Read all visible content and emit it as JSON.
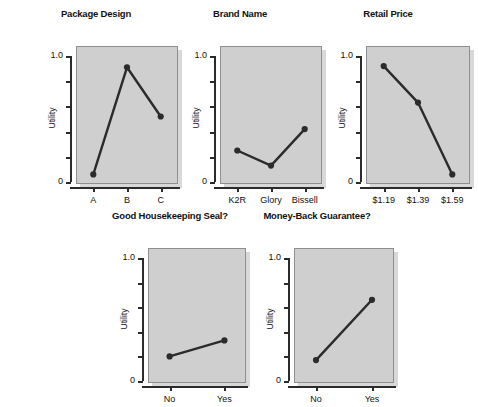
{
  "figure": {
    "background_color": "#ffffff",
    "panel_background_color": "#cfcfcf",
    "ink_color": "#2b2b2b",
    "ylabel": "Utility",
    "ytick_labels": [
      "1.0",
      "0"
    ]
  },
  "chart_data": [
    {
      "type": "line",
      "title": "Package Design",
      "xlabel": "",
      "ylabel": "Utility",
      "categories": [
        "A",
        "B",
        "C"
      ],
      "values": [
        0.06,
        0.91,
        0.52
      ],
      "ylim": [
        0,
        1.15
      ],
      "yticks": [
        0,
        1.0
      ],
      "ytick_labels": [
        "0",
        "1.0"
      ],
      "grid": false,
      "legend": "none",
      "markers": true
    },
    {
      "type": "line",
      "title": "Brand Name",
      "xlabel": "",
      "ylabel": "Utility",
      "categories": [
        "K2R",
        "Glory",
        "Bissell"
      ],
      "values": [
        0.25,
        0.13,
        0.42
      ],
      "ylim": [
        0,
        1.15
      ],
      "yticks": [
        0,
        1.0
      ],
      "ytick_labels": [
        "0",
        "1.0"
      ],
      "grid": false,
      "legend": "none",
      "markers": true
    },
    {
      "type": "line",
      "title": "Retail Price",
      "xlabel": "",
      "ylabel": "Utility",
      "categories": [
        "$1.19",
        "$1.39",
        "$1.59"
      ],
      "values": [
        0.92,
        0.63,
        0.06
      ],
      "ylim": [
        0,
        1.15
      ],
      "yticks": [
        0,
        1.0
      ],
      "ytick_labels": [
        "0",
        "1.0"
      ],
      "grid": false,
      "legend": "none",
      "markers": true
    },
    {
      "type": "line",
      "title": "Good Housekeeping Seal?",
      "xlabel": "",
      "ylabel": "Utility",
      "categories": [
        "No",
        "Yes"
      ],
      "values": [
        0.2,
        0.33
      ],
      "ylim": [
        0,
        1.15
      ],
      "yticks": [
        0,
        1.0
      ],
      "ytick_labels": [
        "0",
        "1.0"
      ],
      "grid": false,
      "legend": "none",
      "markers": true
    },
    {
      "type": "line",
      "title": "Money-Back Guarantee?",
      "xlabel": "",
      "ylabel": "Utility",
      "categories": [
        "No",
        "Yes"
      ],
      "values": [
        0.17,
        0.66
      ],
      "ylim": [
        0,
        1.15
      ],
      "yticks": [
        0,
        1.0
      ],
      "ytick_labels": [
        "0",
        "1.0"
      ],
      "grid": false,
      "legend": "none",
      "markers": true
    }
  ],
  "layout": {
    "panels": [
      {
        "left": 28,
        "top": 8,
        "width": 136,
        "height": 196,
        "plot_left": 48,
        "plot_top": 38,
        "plot_width": 102,
        "plot_height": 138
      },
      {
        "left": 172,
        "top": 8,
        "width": 136,
        "height": 196,
        "plot_left": 48,
        "plot_top": 38,
        "plot_width": 102,
        "plot_height": 138
      },
      {
        "left": 318,
        "top": 8,
        "width": 140,
        "height": 196,
        "plot_left": 48,
        "plot_top": 38,
        "plot_width": 104,
        "plot_height": 138
      },
      {
        "left": 100,
        "top": 210,
        "width": 140,
        "height": 190,
        "plot_left": 48,
        "plot_top": 38,
        "plot_width": 98,
        "plot_height": 135
      },
      {
        "left": 246,
        "top": 210,
        "width": 142,
        "height": 190,
        "plot_left": 48,
        "plot_top": 38,
        "plot_width": 100,
        "plot_height": 135
      }
    ]
  }
}
